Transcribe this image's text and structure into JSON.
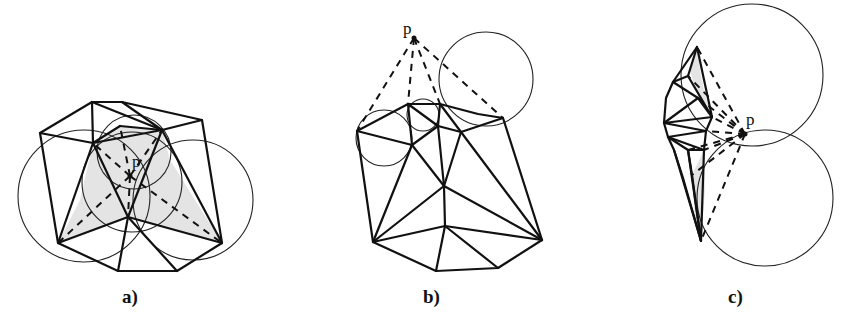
{
  "figure": {
    "panels": [
      {
        "id": "a",
        "caption": "a)",
        "point_label": "p"
      },
      {
        "id": "b",
        "caption": "b)",
        "point_label": "p"
      },
      {
        "id": "c",
        "caption": "c)",
        "point_label": "p"
      }
    ]
  },
  "colors": {
    "edge": "#111111",
    "circle": "#222222",
    "shade": "#e4e4e4",
    "background": "#ffffff"
  }
}
